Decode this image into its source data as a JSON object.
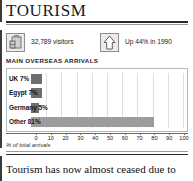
{
  "page": {
    "title": "TOURISM",
    "body_paragraph": "Tourism has now almost ceased due to"
  },
  "stats": [
    {
      "icon": "suitcase-icon",
      "value": "32,789 visitors"
    },
    {
      "icon": "up-arrow-icon",
      "value": "Up 44% in 1990"
    }
  ],
  "chart_section": {
    "heading": "MAIN OVERSEAS ARRIVALS",
    "caption": "% of total arrivals"
  },
  "chart_data": {
    "type": "bar",
    "orientation": "horizontal",
    "title": "MAIN OVERSEAS ARRIVALS",
    "xlabel": "% of total arrivals",
    "ylabel": "",
    "categories": [
      "UK",
      "Egypt",
      "Germany",
      "Other"
    ],
    "values": [
      7,
      7,
      5,
      81
    ],
    "bar_labels": [
      "UK 7%",
      "Egypt 7%",
      "Germany 5%",
      "Other 81%"
    ],
    "xlim": [
      0,
      100
    ],
    "xticks": [
      0,
      10,
      20,
      30,
      40,
      50,
      60,
      70,
      80,
      90,
      100
    ],
    "xtick_labels": [
      "0",
      "10",
      "20",
      "30",
      "40",
      "50",
      "60",
      "70",
      "80",
      "90",
      "100"
    ],
    "grid": true,
    "legend": false,
    "colors": {
      "bar_small": "#6e6e6e",
      "bar_large": "#9c9c9c",
      "gridline": "#dedede",
      "panel_border": "#b9b9b9"
    }
  }
}
